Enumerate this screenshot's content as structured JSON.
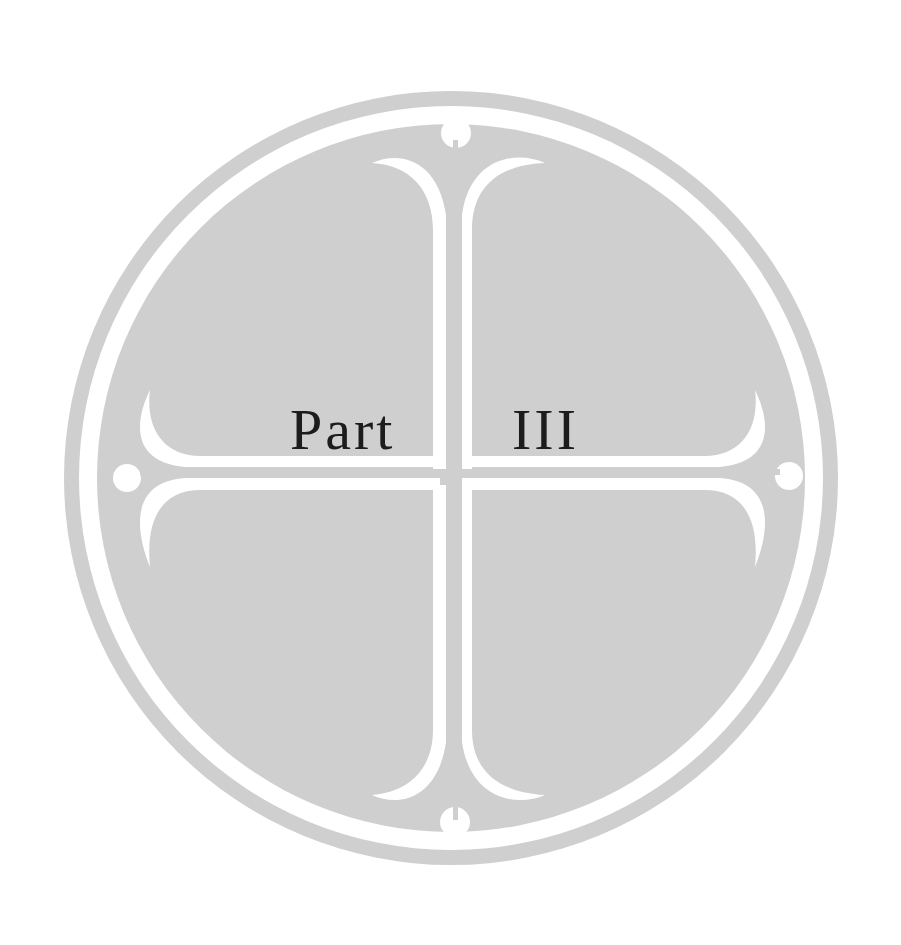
{
  "page": {
    "heading_word": "Part",
    "heading_numeral": "III"
  },
  "colors": {
    "background": "#ffffff",
    "disc_grey": "#cfcfcf",
    "ornament_white": "#ffffff",
    "text": "#1c1c1c"
  },
  "emblem": {
    "type": "circle-cross-ornament",
    "description": "Grey circular medallion with outer ring and a white fleur-like cross with four terminal dots"
  }
}
